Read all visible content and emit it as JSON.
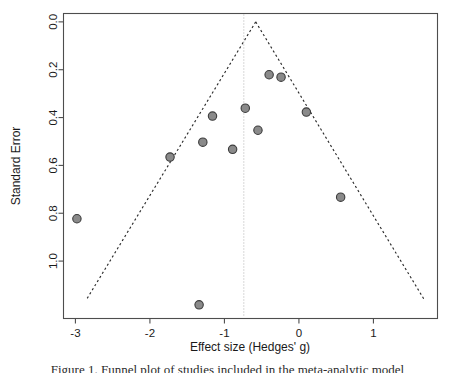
{
  "figure": {
    "caption": "Figure 1. Funnel plot of studies included in the meta-analytic model",
    "background_color": "#ffffff"
  },
  "chart_data": {
    "type": "scatter",
    "title": "",
    "xlabel": "Effect size (Hedges' g)",
    "ylabel": "Standard Error",
    "xlim": [
      -3.16,
      1.86
    ],
    "ylim": [
      1.24,
      -0.035
    ],
    "y_inverted": true,
    "grid": false,
    "legend": null,
    "x_ticks": [
      "-3",
      "-2",
      "-1",
      "0",
      "1"
    ],
    "x_tick_values": [
      -3,
      -2,
      -1,
      0,
      1
    ],
    "y_ticks": [
      "0.0",
      "0.2",
      "0.4",
      "0.6",
      "0.8",
      "1.0"
    ],
    "y_tick_values": [
      0.0,
      0.2,
      0.4,
      0.6,
      0.8,
      1.0
    ],
    "point_color": "#8a8a8a",
    "point_edge_color": "#3b3b3b",
    "point_radius": 4.2,
    "line_color": "#2b2b2b",
    "reference_line_color": "#b9b9b9",
    "axis_color": "#4d4d4d",
    "points": [
      {
        "x": -2.98,
        "y": 0.823,
        "label": "study-1"
      },
      {
        "x": -1.73,
        "y": 0.565,
        "label": "study-2"
      },
      {
        "x": -1.34,
        "y": 1.183,
        "label": "study-3"
      },
      {
        "x": -1.29,
        "y": 0.503,
        "label": "study-4"
      },
      {
        "x": -1.16,
        "y": 0.394,
        "label": "study-5"
      },
      {
        "x": -0.89,
        "y": 0.533,
        "label": "study-6"
      },
      {
        "x": -0.72,
        "y": 0.361,
        "label": "study-7"
      },
      {
        "x": -0.55,
        "y": 0.453,
        "label": "study-8"
      },
      {
        "x": -0.4,
        "y": 0.221,
        "label": "study-9"
      },
      {
        "x": -0.24,
        "y": 0.231,
        "label": "study-10"
      },
      {
        "x": 0.1,
        "y": 0.377,
        "label": "study-11"
      },
      {
        "x": 0.56,
        "y": 0.733,
        "label": "study-12"
      }
    ],
    "funnel": {
      "apex_x": -0.58,
      "apex_y": 0.0,
      "z": 1.96,
      "left_base_x": -2.85,
      "right_base_x": 1.68,
      "base_y": 1.16,
      "style": "dashed"
    },
    "reference_line": {
      "x": -0.74,
      "style": "dotted",
      "description": "pooled effect reference line"
    }
  }
}
